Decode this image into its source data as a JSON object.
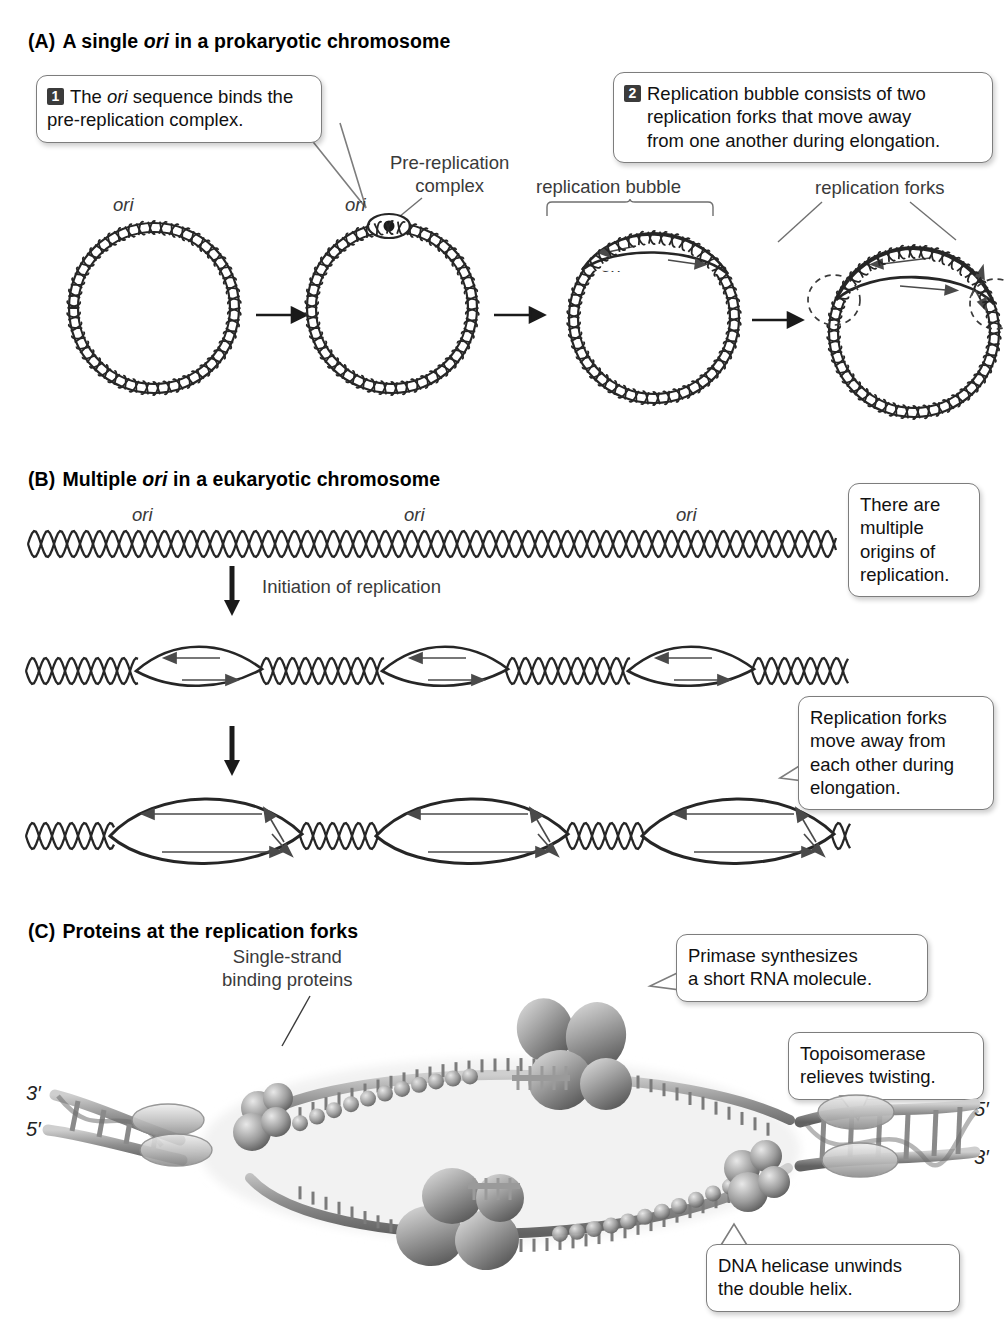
{
  "figure": {
    "title_implicit": "DNA replication: origins of replication and proteins at the replication fork",
    "sections": [
      {
        "key": "A",
        "lead": "(A)",
        "title_plain": "A single ",
        "title_italic": "ori",
        "title_rest": " in a prokaryotic chromosome"
      },
      {
        "key": "B",
        "lead": "(B)",
        "title_plain": "Multiple ",
        "title_italic": "ori",
        "title_rest": " in a eukaryotic chromosome"
      },
      {
        "key": "C",
        "lead": "(C)",
        "title_plain": "Proteins at the replication forks",
        "title_italic": "",
        "title_rest": ""
      }
    ]
  },
  "panelA": {
    "callout1": {
      "number": "1",
      "line1": "The ",
      "ital": "ori",
      "line1b": " sequence binds the",
      "line2": "pre-replication complex."
    },
    "callout2": {
      "number": "2",
      "line1": "Replication bubble consists of two",
      "line2": "replication forks that move away",
      "line3": "from one another during elongation."
    },
    "labels": {
      "ori_1": "ori",
      "ori_2": "ori",
      "ori_3": "ori",
      "ori_4": "ori",
      "pre_replication_complex_l1": "Pre-replication",
      "pre_replication_complex_l2": "complex",
      "replication_bubble": "replication bubble",
      "replication_forks": "replication forks"
    },
    "stages": 4,
    "arrow_glyph": "→"
  },
  "panelB": {
    "labels": {
      "ori_1": "ori",
      "ori_2": "ori",
      "ori_3": "ori"
    },
    "step_arrow_label": "Initiation of replication",
    "callout_top": {
      "line1": "There are",
      "line2": "multiple",
      "line3": "origins of",
      "line4": "replication."
    },
    "callout_bottom": {
      "line1": "Replication forks",
      "line2": "move away from",
      "line3": "each other during",
      "line4": "elongation."
    },
    "rows": [
      {
        "id": "row-unreplicated",
        "bubbles": 0
      },
      {
        "id": "row-small-bubbles",
        "bubbles": 3
      },
      {
        "id": "row-large-bubbles",
        "bubbles": 3
      }
    ]
  },
  "panelC": {
    "labels": {
      "ssb_l1": "Single-strand",
      "ssb_l2": "binding proteins",
      "rna_primer": "RNA primer",
      "five_prime_top": "5′",
      "five_prime_bottom": "5′",
      "end_left_top": "3′",
      "end_left_bottom": "5′",
      "end_right_top": "5′",
      "end_right_bottom": "3′"
    },
    "callout_primase": {
      "line1": "Primase synthesizes",
      "line2": "a short RNA molecule."
    },
    "callout_topoisomerase": {
      "line1": "Topoisomerase",
      "line2": "relieves twisting."
    },
    "callout_helicase": {
      "line1": "DNA helicase unwinds",
      "line2": "the double helix."
    }
  },
  "colors": {
    "ink": "#1a1a1a",
    "label_gray": "#3a3a3a",
    "balloon_border": "#7d7d7d",
    "number_badge": "#3b3b3b",
    "dna_stroke": "#262626",
    "protein_light": "#d8d8d8",
    "protein_mid": "#9a9a9a",
    "protein_dark": "#5c5c5c"
  }
}
